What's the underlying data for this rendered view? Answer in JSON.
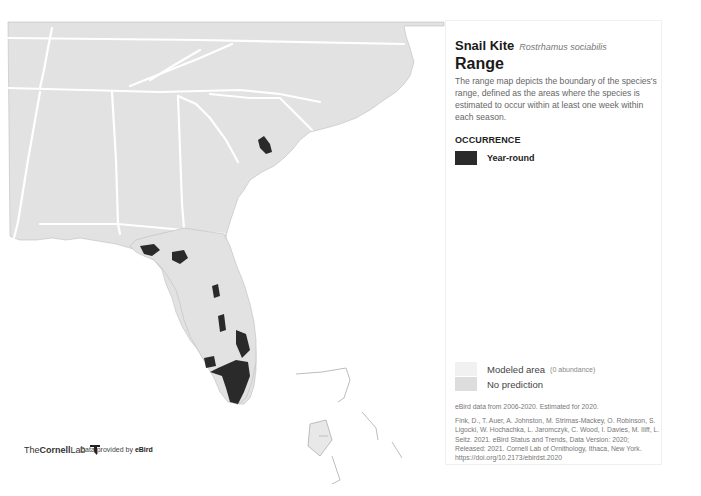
{
  "species": {
    "common_name": "Snail Kite",
    "scientific_name": "Rostrhamus sociabilis"
  },
  "section": {
    "title": "Range",
    "description": "The range map depicts the boundary of the species's range, defined as the areas where the species is estimated to occur within at least one week within each season."
  },
  "legend": {
    "occurrence_heading": "OCCURRENCE",
    "items": [
      {
        "label": "Year-round",
        "color": "#2a2a2a"
      }
    ],
    "modeled_area": {
      "label": "Modeled area",
      "note": "(0 abundance)",
      "color": "#f1f1f1"
    },
    "no_prediction": {
      "label": "No prediction",
      "color": "#dddddd"
    }
  },
  "data_note": "eBird data from 2006-2020. Estimated for 2020.",
  "citation": "Fink, D., T. Auer, A. Johnston, M. Strimas-Mackey, O. Robinson, S. Ligocki, W. Hochachka, L. Jaromczyk, C. Wood, I. Davies, M. Iliff, L. Seitz. 2021. eBird Status and Trends, Data Version: 2020; Released: 2021. Cornell Lab of Ornithology, Ithaca, New York. https://doi.org/10.2173/ebirdst.2020",
  "footer": {
    "logo_prefix": "The",
    "logo_bold": "Cornell",
    "logo_suffix": "Lab",
    "provided_prefix": "Data provided by",
    "provided_brand": "eBird"
  },
  "map": {
    "land_color": "#e2e2e2",
    "border_color": "#ffffff",
    "range_color": "#2a2a2a",
    "region": "Southeastern United States"
  }
}
